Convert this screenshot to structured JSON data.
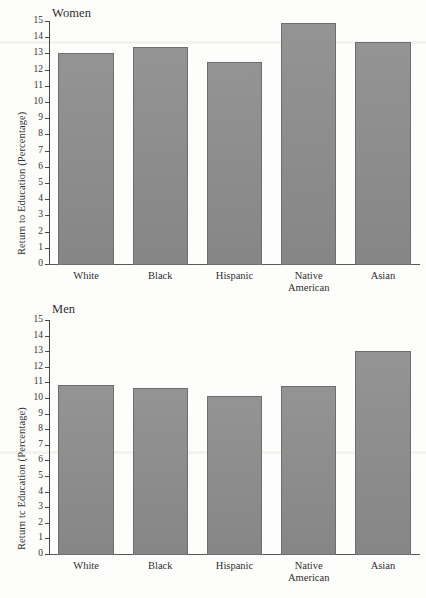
{
  "figure": {
    "ylabel": "Return to Education (Percentage)",
    "ylabel_men": "Return tc Education (Percentage)",
    "categories": [
      "White",
      "Black",
      "Hispanic",
      "Native American",
      "Asian"
    ],
    "tick_labels": [
      "15",
      "14",
      "13",
      "12",
      "11",
      "10",
      "9",
      "8",
      "7",
      "6",
      "5",
      "4",
      "3",
      "2",
      "1",
      "0"
    ],
    "bar_color": "#8d8d8d",
    "bar_edge_color": "#6e6e6e",
    "axis_color": "#4a4a4a"
  },
  "chart_data": [
    {
      "type": "bar",
      "title": "Women",
      "categories": [
        "White",
        "Black",
        "Hispanic",
        "Native American",
        "Asian"
      ],
      "values": [
        13.0,
        13.4,
        12.45,
        14.9,
        13.7
      ],
      "xlabel": "",
      "ylabel": "Return to Education (Percentage)",
      "ylim": [
        0,
        15
      ],
      "ytick_step": 1,
      "grid": false,
      "legend": "none"
    },
    {
      "type": "bar",
      "title": "Men",
      "categories": [
        "White",
        "Black",
        "Hispanic",
        "Native American",
        "Asian"
      ],
      "values": [
        10.85,
        10.65,
        10.15,
        10.8,
        13.0
      ],
      "xlabel": "",
      "ylabel": "Return to Education (Percentage)",
      "ylim": [
        0,
        15
      ],
      "ytick_step": 1,
      "grid": false,
      "legend": "none"
    }
  ],
  "panels": {
    "women": {
      "title": "Women",
      "cat_lines": [
        [
          "White"
        ],
        [
          "Black"
        ],
        [
          "Hispanic"
        ],
        [
          "Native",
          "American"
        ],
        [
          "Asian"
        ]
      ]
    },
    "men": {
      "title": "Men",
      "cat_lines": [
        [
          "White"
        ],
        [
          "Black"
        ],
        [
          "Hispanic"
        ],
        [
          "Native",
          "American"
        ],
        [
          "Asian"
        ]
      ]
    }
  }
}
